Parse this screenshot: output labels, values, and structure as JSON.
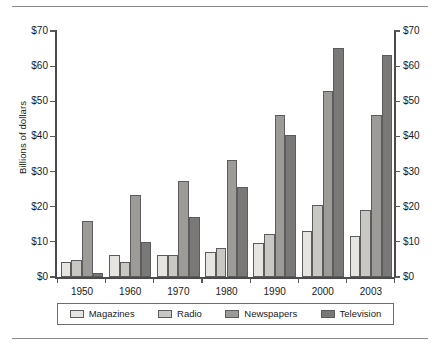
{
  "chart_data": {
    "type": "bar",
    "title": "",
    "subtitle": "",
    "xlabel": "",
    "ylabel": "Billions of dollars",
    "categories": [
      "1950",
      "1960",
      "1970",
      "1980",
      "1990",
      "2000",
      "2003"
    ],
    "series": [
      {
        "name": "Magazines",
        "color": "#e7e5e2",
        "values": [
          4.2,
          6.4,
          6.4,
          7.2,
          9.8,
          13.0,
          11.7
        ]
      },
      {
        "name": "Radio",
        "color": "#c9c7c4",
        "values": [
          4.8,
          4.3,
          6.4,
          8.2,
          12.1,
          20.4,
          19.2
        ]
      },
      {
        "name": "Newspapers",
        "color": "#9d9b98",
        "values": [
          16.0,
          23.3,
          27.4,
          33.4,
          46.2,
          53.0,
          46.0
        ]
      },
      {
        "name": "Television",
        "color": "#7b7977",
        "values": [
          1.2,
          10.1,
          17.2,
          25.7,
          40.5,
          65.3,
          63.2
        ]
      }
    ],
    "ylim": [
      0,
      70
    ],
    "yticks": [
      0,
      10,
      20,
      30,
      40,
      50,
      60,
      70
    ],
    "ytick_labels": [
      "$0",
      "$10",
      "$20",
      "$30",
      "$40",
      "$50",
      "$60",
      "$70"
    ],
    "right_axis": true,
    "right_ytick_labels": [
      "$0",
      "$10",
      "$20",
      "$30",
      "$40",
      "$50",
      "$60",
      "$70"
    ],
    "grid": false,
    "legend_position": "bottom",
    "legend_entries": [
      "Magazines",
      "Radio",
      "Newspapers",
      "Television"
    ]
  }
}
